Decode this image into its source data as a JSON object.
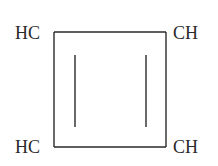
{
  "molecule": {
    "name": "cyclobutadiene",
    "atoms": [
      {
        "id": "top-left",
        "label": "HC"
      },
      {
        "id": "top-right",
        "label": "CH"
      },
      {
        "id": "bottom-left",
        "label": "HC"
      },
      {
        "id": "bottom-right",
        "label": "CH"
      }
    ],
    "bonds": [
      {
        "from": "top-left",
        "to": "top-right",
        "order": 1
      },
      {
        "from": "top-right",
        "to": "bottom-right",
        "order": 2
      },
      {
        "from": "bottom-right",
        "to": "bottom-left",
        "order": 1
      },
      {
        "from": "bottom-left",
        "to": "top-left",
        "order": 2
      }
    ]
  },
  "colors": {
    "ink": "#2a2a2a",
    "background": "#ffffff"
  }
}
